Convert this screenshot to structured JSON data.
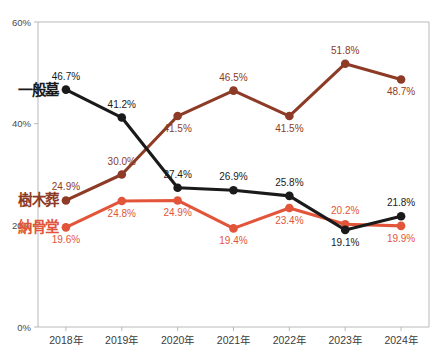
{
  "chart_data": {
    "type": "line",
    "title": "",
    "xlabel": "",
    "ylabel": "",
    "categories": [
      "2018年",
      "2019年",
      "2020年",
      "2021年",
      "2022年",
      "2023年",
      "2024年"
    ],
    "ylim": [
      0,
      60
    ],
    "ytick_labels": [
      "0%",
      "20%",
      "40%",
      "60%"
    ],
    "ytick_values": [
      0,
      20,
      40,
      60
    ],
    "grid": false,
    "legend_position": "inline-left",
    "series": [
      {
        "name": "一般墓",
        "color": "#1a1a1a",
        "values": [
          46.7,
          41.2,
          27.4,
          26.9,
          25.8,
          19.1,
          21.8
        ],
        "labels": [
          "46.7%",
          "41.2%",
          "27.4%",
          "26.9%",
          "25.8%",
          "19.1%",
          "21.8%"
        ],
        "label_positions": [
          "above",
          "above",
          "above",
          "above",
          "above",
          "below",
          "above"
        ]
      },
      {
        "name": "樹木葬",
        "color": "#8d3b26",
        "values": [
          24.9,
          30.0,
          41.5,
          46.5,
          41.5,
          51.8,
          48.7
        ],
        "labels": [
          "24.9%",
          "30.0%",
          "41.5%",
          "46.5%",
          "41.5%",
          "51.8%",
          "48.7%"
        ],
        "label_positions": [
          "above",
          "above",
          "below",
          "above",
          "below",
          "above",
          "below"
        ]
      },
      {
        "name": "納骨堂",
        "color": "#e2553a",
        "values": [
          19.6,
          24.8,
          24.9,
          19.4,
          23.4,
          20.2,
          19.9
        ],
        "labels": [
          "19.6%",
          "24.8%",
          "24.9%",
          "19.4%",
          "23.4%",
          "20.2%",
          "19.9%"
        ],
        "label_positions": [
          "below",
          "below",
          "below",
          "below",
          "below",
          "above",
          "below"
        ]
      }
    ]
  },
  "axis": {
    "frame_color": "#b9b9b9"
  }
}
